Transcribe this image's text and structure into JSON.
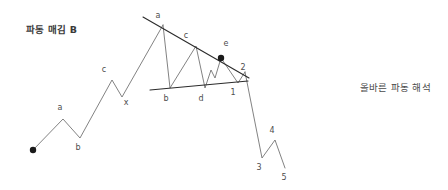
{
  "figure": {
    "title_left": "파동 매김 B",
    "title_right": "올바른 파동 해석",
    "background_color": "#ffffff",
    "line_color": "#6b6b6b",
    "trendline_color": "#2b2b2b",
    "marker_color": "#1a1a1a",
    "label_color": "#4d4d4d"
  },
  "chart_data": {
    "type": "line",
    "title": "파동 매김 B",
    "subtitle": "올바른 파동 해석",
    "xlabel": "",
    "ylabel": "",
    "grid": false,
    "legend": "none",
    "xlim": [
      0,
      448
    ],
    "ylim": [
      190,
      0
    ],
    "annotations": [
      {
        "text": "파동 매김 B",
        "x": 26,
        "y": 22
      },
      {
        "text": "올바른 파동 해석",
        "x": 360,
        "y": 80
      }
    ],
    "series": [
      {
        "name": "leading-zigzag",
        "points": [
          {
            "x": 33,
            "y": 150
          },
          {
            "x": 63,
            "y": 119
          },
          {
            "x": 80,
            "y": 138
          },
          {
            "x": 112,
            "y": 80
          },
          {
            "x": 122,
            "y": 97
          },
          {
            "x": 163,
            "y": 25
          }
        ]
      },
      {
        "name": "triangle-zigzag",
        "points": [
          {
            "x": 163,
            "y": 25
          },
          {
            "x": 170,
            "y": 88
          },
          {
            "x": 196,
            "y": 46
          },
          {
            "x": 205,
            "y": 88
          },
          {
            "x": 211,
            "y": 70
          },
          {
            "x": 215,
            "y": 78
          },
          {
            "x": 221,
            "y": 58
          },
          {
            "x": 238,
            "y": 83
          },
          {
            "x": 245,
            "y": 72
          }
        ]
      },
      {
        "name": "impulse-down",
        "points": [
          {
            "x": 245,
            "y": 72
          },
          {
            "x": 262,
            "y": 158
          },
          {
            "x": 275,
            "y": 140
          },
          {
            "x": 285,
            "y": 168
          }
        ]
      },
      {
        "name": "upper-trendline",
        "points": [
          {
            "x": 143,
            "y": 17
          },
          {
            "x": 249,
            "y": 78
          }
        ]
      },
      {
        "name": "lower-trendline",
        "points": [
          {
            "x": 150,
            "y": 90
          },
          {
            "x": 248,
            "y": 81
          }
        ]
      }
    ],
    "markers": [
      {
        "name": "origin-dot",
        "x": 33,
        "y": 150
      },
      {
        "name": "wave-e-dot",
        "x": 221,
        "y": 58
      }
    ],
    "point_labels": [
      {
        "text": "a",
        "x": 60,
        "y": 110
      },
      {
        "text": "b",
        "x": 78,
        "y": 150
      },
      {
        "text": "c",
        "x": 104,
        "y": 72
      },
      {
        "text": "x",
        "x": 126,
        "y": 105
      },
      {
        "text": "a",
        "x": 158,
        "y": 18
      },
      {
        "text": "b",
        "x": 166,
        "y": 101
      },
      {
        "text": "c",
        "x": 186,
        "y": 38
      },
      {
        "text": "d",
        "x": 201,
        "y": 101
      },
      {
        "text": "e",
        "x": 226,
        "y": 46
      },
      {
        "text": "1",
        "x": 233,
        "y": 95
      },
      {
        "text": "2",
        "x": 243,
        "y": 70
      },
      {
        "text": "3",
        "x": 259,
        "y": 170
      },
      {
        "text": "4",
        "x": 272,
        "y": 133
      },
      {
        "text": "5",
        "x": 284,
        "y": 180
      }
    ]
  }
}
